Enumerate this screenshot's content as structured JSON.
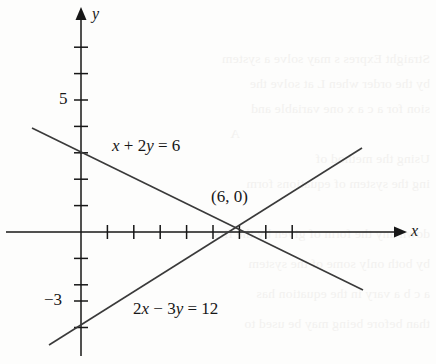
{
  "figure": {
    "kind": "coordinate-plane-graph",
    "width": 436,
    "height": 364,
    "background_color": "#fdfdfc",
    "ink_color": "#171717"
  },
  "axes": {
    "x_axis_label": "x",
    "y_axis_label": "y",
    "origin_px": [
      81,
      232
    ],
    "unit_px": 26.4,
    "x_range_units": [
      -2,
      12
    ],
    "y_range_units": [
      -5,
      8.5
    ],
    "x_tick_units": [
      1,
      2,
      3,
      4,
      5,
      6,
      7,
      8
    ],
    "y_tick_units": [
      1,
      2,
      3,
      4,
      5,
      6,
      7,
      8,
      -1,
      -2,
      -3,
      -4
    ],
    "x_labeled_ticks": [],
    "y_labeled_ticks": [
      {
        "value": 5,
        "text": "5"
      },
      {
        "value": -3,
        "text": "−3"
      }
    ],
    "arrowheads": [
      "x-positive",
      "y-positive"
    ],
    "grid": false
  },
  "chart_data": {
    "type": "line",
    "title": "",
    "xlabel": "x",
    "ylabel": "y",
    "xlim": [
      -2,
      12
    ],
    "ylim": [
      -5,
      8.5
    ],
    "grid": false,
    "legend_position": "inline-annotations",
    "series": [
      {
        "name": "x + 2y = 6",
        "label": "x + 2y = 6",
        "equation": "x + 2y = 6",
        "slope": -0.5,
        "y_intercept": 3,
        "x_intercept": 6,
        "endpoints_units": [
          [
            -1.85,
            3.93
          ],
          [
            10.7,
            -2.2
          ]
        ],
        "endpoints_px": [
          [
            32,
            128
          ],
          [
            363,
            290
          ]
        ],
        "label_px": [
          112,
          147
        ]
      },
      {
        "name": "2x - 3y = 12",
        "label": "2x − 3y = 12",
        "equation": "2x − 3y = 12",
        "slope": 0.6667,
        "y_intercept": -4,
        "x_intercept": 6,
        "endpoints_units": [
          [
            -1.21,
            -4.28
          ],
          [
            10.64,
            3.18
          ]
        ],
        "endpoints_px": [
          [
            49,
            345
          ],
          [
            362,
            148
          ]
        ],
        "label_px": [
          133,
          310
        ]
      }
    ],
    "points": [
      {
        "label": "(6, 0)",
        "x": 6,
        "y": 0,
        "px": [
          238,
          232
        ],
        "label_px": [
          212,
          196
        ],
        "note": "intersection of the two lines"
      }
    ]
  },
  "annotations": {
    "equation_1": "x + 2y = 6",
    "equation_2": "2x − 3y = 12",
    "intersection_point": "(6, 0)",
    "y_tick_5": "5",
    "y_tick_neg3": "−3",
    "x_axis_name": "x",
    "y_axis_name": "y"
  },
  "page_bleed": {
    "visible": true,
    "description": "faint mirrored text showing through from the reverse side of the page",
    "color": "#f2f1ef",
    "lines": [
      "Straight Expres    s may solve a system",
      "by the order            when L at solve the",
      "sion  for a  c   a   x    one  variable  and",
      "A",
      "Using the method of",
      "ing the  system  of  equations   form",
      "down any the form of given by  the  first",
      "by both   only  some  of  the   system",
      "a c b   a   vary   in  the  equation   has",
      "than   before  being  may  be  used  to"
    ]
  }
}
